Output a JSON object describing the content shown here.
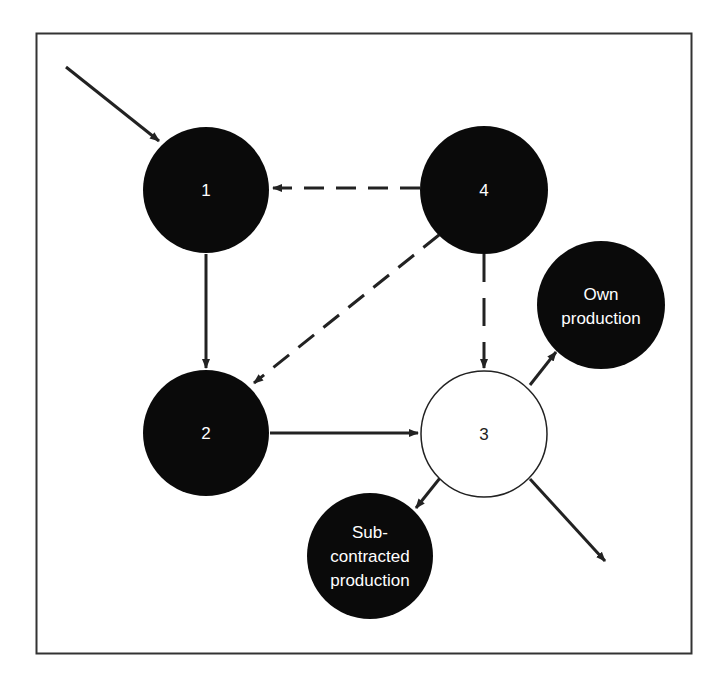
{
  "diagram": {
    "colors": {
      "node_fill": "#0a0a0a",
      "node_text": "#ffffff",
      "open_node_fill": "#ffffff",
      "stroke": "#222222",
      "frame": "#333333"
    },
    "nodes": [
      {
        "id": "1",
        "label": "1",
        "filled": true
      },
      {
        "id": "2",
        "label": "2",
        "filled": true
      },
      {
        "id": "3",
        "label": "3",
        "filled": false
      },
      {
        "id": "4",
        "label": "4",
        "filled": true
      },
      {
        "id": "own",
        "label_lines": [
          "Own",
          "production"
        ],
        "filled": true
      },
      {
        "id": "sub",
        "label_lines": [
          "Sub-",
          "contracted",
          "production"
        ],
        "filled": true
      }
    ],
    "edges": [
      {
        "from": "external",
        "to": "1",
        "style": "solid"
      },
      {
        "from": "1",
        "to": "2",
        "style": "solid"
      },
      {
        "from": "2",
        "to": "3",
        "style": "solid"
      },
      {
        "from": "4",
        "to": "1",
        "style": "dashed"
      },
      {
        "from": "4",
        "to": "2",
        "style": "dashed"
      },
      {
        "from": "4",
        "to": "3",
        "style": "dashed"
      },
      {
        "from": "3",
        "to": "own",
        "style": "solid"
      },
      {
        "from": "3",
        "to": "sub",
        "style": "solid"
      },
      {
        "from": "3",
        "to": "external",
        "style": "solid"
      }
    ]
  }
}
